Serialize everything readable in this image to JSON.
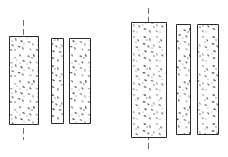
{
  "figure": {
    "background_color": "#ffffff",
    "outline_color": "#2b2b2b",
    "hatch_color": "#7c7c7c",
    "centerline_color": "#4a4a4a",
    "width": 228,
    "height": 157
  },
  "chart_data": {
    "type": "table",
    "xlabel": "",
    "ylabel": "",
    "categories": [
      "left-group-wide-panel",
      "left-group-narrow-panel",
      "left-group-medium-panel",
      "right-group-wide-panel",
      "right-group-narrow-panel",
      "right-group-medium-panel"
    ],
    "values": [
      29,
      12,
      21,
      35,
      14,
      21
    ]
  },
  "groups": [
    {
      "name": "left-group",
      "label": "Left section group",
      "panels": [
        {
          "name": "left-wide-panel",
          "label": "Wide panel",
          "x": 9,
          "y": 36,
          "width": 29,
          "height": 88,
          "has_centerline": true,
          "centerline_x": 23,
          "centerline_top": 20,
          "centerline_bottom": 140
        },
        {
          "name": "left-narrow-panel",
          "label": "Narrow panel",
          "x": 51,
          "y": 38,
          "width": 12,
          "height": 85,
          "has_centerline": false
        },
        {
          "name": "left-medium-panel",
          "label": "Medium panel",
          "x": 69,
          "y": 38,
          "width": 21,
          "height": 85,
          "has_centerline": false
        }
      ]
    },
    {
      "name": "right-group",
      "label": "Right section group",
      "panels": [
        {
          "name": "right-wide-panel",
          "label": "Wide panel",
          "x": 131,
          "y": 22,
          "width": 35,
          "height": 115,
          "has_centerline": true,
          "centerline_x": 148,
          "centerline_top": 8,
          "centerline_bottom": 152
        },
        {
          "name": "right-narrow-panel",
          "label": "Narrow panel",
          "x": 176,
          "y": 24,
          "width": 14,
          "height": 110,
          "has_centerline": false
        },
        {
          "name": "right-medium-panel",
          "label": "Medium panel",
          "x": 197,
          "y": 24,
          "width": 21,
          "height": 110,
          "has_centerline": false
        }
      ]
    }
  ]
}
